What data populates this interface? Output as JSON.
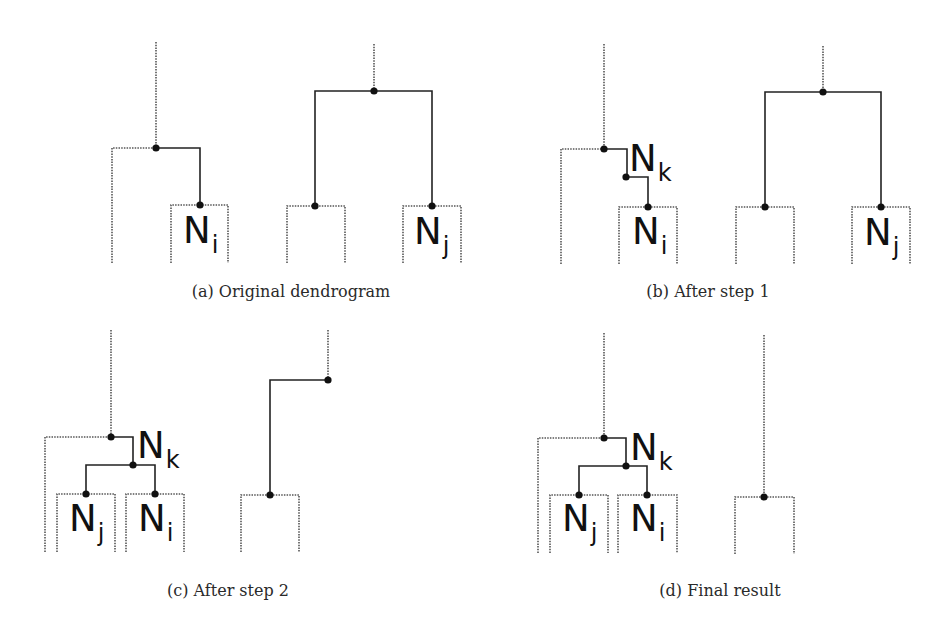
{
  "figure": {
    "colors": {
      "solid": "#222222",
      "dotted": "#555555",
      "dot": "#111111",
      "background": "#ffffff"
    },
    "panels": [
      {
        "id": "a",
        "caption": "(a) Original dendrogram",
        "caption_pos": [
          291,
          282
        ],
        "lines": [
          {
            "style": "dotted",
            "pts": [
              [
                156,
                42
              ],
              [
                156,
                148
              ]
            ]
          },
          {
            "style": "dotted",
            "pts": [
              [
                112,
                263
              ],
              [
                112,
                148
              ],
              [
                156,
                148
              ]
            ]
          },
          {
            "style": "solid",
            "pts": [
              [
                156,
                148
              ],
              [
                200,
                148
              ],
              [
                200,
                205
              ]
            ]
          },
          {
            "style": "dotted",
            "pts": [
              [
                171,
                263
              ],
              [
                171,
                205
              ],
              [
                228,
                205
              ],
              [
                228,
                263
              ]
            ]
          },
          {
            "style": "dotted",
            "pts": [
              [
                374,
                44
              ],
              [
                374,
                91
              ]
            ]
          },
          {
            "style": "solid",
            "pts": [
              [
                315,
                206
              ],
              [
                315,
                91
              ],
              [
                432,
                91
              ],
              [
                432,
                206
              ]
            ]
          },
          {
            "style": "dotted",
            "pts": [
              [
                287,
                263
              ],
              [
                287,
                206
              ],
              [
                345,
                206
              ],
              [
                345,
                263
              ]
            ]
          },
          {
            "style": "dotted",
            "pts": [
              [
                403,
                263
              ],
              [
                403,
                206
              ],
              [
                461,
                206
              ],
              [
                461,
                263
              ]
            ]
          }
        ],
        "dots": [
          [
            156,
            148
          ],
          [
            200,
            205
          ],
          [
            374,
            91
          ],
          [
            315,
            206
          ],
          [
            432,
            206
          ]
        ],
        "labels": [
          {
            "main": "N",
            "sub": "i",
            "x": 183,
            "y": 212
          },
          {
            "main": "N",
            "sub": "j",
            "x": 414,
            "y": 213
          }
        ]
      },
      {
        "id": "b",
        "caption": "(b) After step 1",
        "caption_pos": [
          708,
          282
        ],
        "lines": [
          {
            "style": "dotted",
            "pts": [
              [
                604,
                44
              ],
              [
                604,
                149
              ]
            ]
          },
          {
            "style": "dotted",
            "pts": [
              [
                561,
                264
              ],
              [
                561,
                149
              ],
              [
                604,
                149
              ]
            ]
          },
          {
            "style": "solid",
            "pts": [
              [
                604,
                149
              ],
              [
                627,
                149
              ],
              [
                627,
                177
              ]
            ]
          },
          {
            "style": "solid",
            "pts": [
              [
                626,
                177
              ],
              [
                648,
                177
              ],
              [
                648,
                207
              ]
            ]
          },
          {
            "style": "dotted",
            "pts": [
              [
                619,
                264
              ],
              [
                619,
                207
              ],
              [
                677,
                207
              ],
              [
                677,
                264
              ]
            ]
          },
          {
            "style": "dotted",
            "pts": [
              [
                823,
                46
              ],
              [
                823,
                92
              ]
            ]
          },
          {
            "style": "solid",
            "pts": [
              [
                765,
                207
              ],
              [
                765,
                92
              ],
              [
                881,
                92
              ],
              [
                881,
                207
              ]
            ]
          },
          {
            "style": "dotted",
            "pts": [
              [
                736,
                264
              ],
              [
                736,
                207
              ],
              [
                794,
                207
              ],
              [
                794,
                264
              ]
            ]
          },
          {
            "style": "dotted",
            "pts": [
              [
                852,
                264
              ],
              [
                852,
                207
              ],
              [
                910,
                207
              ],
              [
                910,
                264
              ]
            ]
          }
        ],
        "dots": [
          [
            604,
            149
          ],
          [
            626,
            177
          ],
          [
            648,
            207
          ],
          [
            823,
            92
          ],
          [
            765,
            207
          ],
          [
            881,
            207
          ]
        ],
        "labels": [
          {
            "main": "N",
            "sub": "k",
            "x": 629,
            "y": 140
          },
          {
            "main": "N",
            "sub": "i",
            "x": 632,
            "y": 213
          },
          {
            "main": "N",
            "sub": "j",
            "x": 864,
            "y": 214
          }
        ]
      },
      {
        "id": "c",
        "caption": "(c) After step 2",
        "caption_pos": [
          228,
          581
        ],
        "lines": [
          {
            "style": "dotted",
            "pts": [
              [
                111,
                330
              ],
              [
                111,
                437
              ]
            ]
          },
          {
            "style": "dotted",
            "pts": [
              [
                45,
                552
              ],
              [
                45,
                437
              ],
              [
                111,
                437
              ]
            ]
          },
          {
            "style": "solid",
            "pts": [
              [
                111,
                437
              ],
              [
                133,
                437
              ],
              [
                133,
                465
              ]
            ]
          },
          {
            "style": "solid",
            "pts": [
              [
                86,
                494
              ],
              [
                86,
                465
              ],
              [
                155,
                465
              ],
              [
                155,
                494
              ]
            ]
          },
          {
            "style": "dotted",
            "pts": [
              [
                57,
                552
              ],
              [
                57,
                494
              ],
              [
                115,
                494
              ],
              [
                115,
                552
              ]
            ]
          },
          {
            "style": "dotted",
            "pts": [
              [
                126,
                552
              ],
              [
                126,
                494
              ],
              [
                184,
                494
              ],
              [
                184,
                552
              ]
            ]
          },
          {
            "style": "dotted",
            "pts": [
              [
                328,
                330
              ],
              [
                328,
                380
              ]
            ]
          },
          {
            "style": "solid",
            "pts": [
              [
                328,
                380
              ],
              [
                270,
                380
              ],
              [
                270,
                495
              ]
            ]
          },
          {
            "style": "dotted",
            "pts": [
              [
                241,
                552
              ],
              [
                241,
                495
              ],
              [
                299,
                495
              ],
              [
                299,
                552
              ]
            ]
          }
        ],
        "dots": [
          [
            111,
            437
          ],
          [
            133,
            465
          ],
          [
            86,
            494
          ],
          [
            155,
            494
          ],
          [
            328,
            380
          ],
          [
            270,
            495
          ]
        ],
        "labels": [
          {
            "main": "N",
            "sub": "k",
            "x": 137,
            "y": 427
          },
          {
            "main": "N",
            "sub": "j",
            "x": 69,
            "y": 500
          },
          {
            "main": "N",
            "sub": "i",
            "x": 138,
            "y": 500
          }
        ]
      },
      {
        "id": "d",
        "caption": "(d) Final result",
        "caption_pos": [
          720,
          581
        ],
        "lines": [
          {
            "style": "dotted",
            "pts": [
              [
                604,
                333
              ],
              [
                604,
                438
              ]
            ]
          },
          {
            "style": "dotted",
            "pts": [
              [
                538,
                553
              ],
              [
                538,
                438
              ],
              [
                604,
                438
              ]
            ]
          },
          {
            "style": "solid",
            "pts": [
              [
                604,
                438
              ],
              [
                626,
                438
              ],
              [
                626,
                466
              ]
            ]
          },
          {
            "style": "solid",
            "pts": [
              [
                579,
                495
              ],
              [
                579,
                466
              ],
              [
                647,
                466
              ],
              [
                647,
                495
              ]
            ]
          },
          {
            "style": "dotted",
            "pts": [
              [
                550,
                553
              ],
              [
                550,
                495
              ],
              [
                608,
                495
              ],
              [
                608,
                553
              ]
            ]
          },
          {
            "style": "dotted",
            "pts": [
              [
                618,
                553
              ],
              [
                618,
                495
              ],
              [
                677,
                495
              ],
              [
                677,
                553
              ]
            ]
          },
          {
            "style": "dotted",
            "pts": [
              [
                764,
                335
              ],
              [
                764,
                497
              ]
            ]
          },
          {
            "style": "dotted",
            "pts": [
              [
                735,
                554
              ],
              [
                735,
                497
              ],
              [
                794,
                497
              ],
              [
                794,
                554
              ]
            ]
          }
        ],
        "dots": [
          [
            604,
            438
          ],
          [
            626,
            466
          ],
          [
            579,
            495
          ],
          [
            647,
            495
          ],
          [
            764,
            497
          ]
        ],
        "labels": [
          {
            "main": "N",
            "sub": "k",
            "x": 630,
            "y": 429
          },
          {
            "main": "N",
            "sub": "j",
            "x": 562,
            "y": 500
          },
          {
            "main": "N",
            "sub": "i",
            "x": 630,
            "y": 500
          }
        ]
      }
    ]
  }
}
